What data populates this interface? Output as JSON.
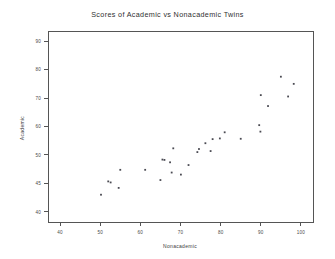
{
  "chart_data": {
    "type": "scatter",
    "title": "Scores of Academic vs Nonacademic Twins",
    "xlabel": "Nonacademic",
    "ylabel": "Academic",
    "xlim": [
      37,
      103
    ],
    "ylim": [
      37,
      93
    ],
    "xticks": [
      40,
      50,
      60,
      70,
      80,
      90,
      100
    ],
    "xticklabels": [
      "40",
      "50",
      "60",
      "70",
      "80",
      "90",
      "100"
    ],
    "yticks": [
      40,
      48.3,
      56.7,
      65,
      73.3,
      81.7,
      90
    ],
    "yticklabels": [
      "40",
      "45",
      "50",
      "60",
      "70",
      "80",
      "90"
    ],
    "grid": false,
    "legend": false,
    "marker": "point",
    "marker_color": "#4a4a52",
    "points": [
      {
        "x": 50.2,
        "y": 45.0
      },
      {
        "x": 52.6,
        "y": 48.6
      },
      {
        "x": 52.0,
        "y": 48.9
      },
      {
        "x": 54.6,
        "y": 47.0
      },
      {
        "x": 55.0,
        "y": 52.3
      },
      {
        "x": 61.2,
        "y": 52.3
      },
      {
        "x": 65.0,
        "y": 49.3
      },
      {
        "x": 65.5,
        "y": 55.3
      },
      {
        "x": 66.0,
        "y": 55.2
      },
      {
        "x": 67.4,
        "y": 54.5
      },
      {
        "x": 67.8,
        "y": 51.5
      },
      {
        "x": 68.2,
        "y": 58.6
      },
      {
        "x": 70.1,
        "y": 50.9
      },
      {
        "x": 72.0,
        "y": 53.7
      },
      {
        "x": 74.2,
        "y": 57.5
      },
      {
        "x": 74.6,
        "y": 58.4
      },
      {
        "x": 76.2,
        "y": 60.1
      },
      {
        "x": 77.5,
        "y": 57.8
      },
      {
        "x": 78.0,
        "y": 61.3
      },
      {
        "x": 79.8,
        "y": 61.5
      },
      {
        "x": 81.0,
        "y": 63.3
      },
      {
        "x": 85.0,
        "y": 61.4
      },
      {
        "x": 89.6,
        "y": 65.4
      },
      {
        "x": 89.9,
        "y": 63.5
      },
      {
        "x": 90.0,
        "y": 74.2
      },
      {
        "x": 91.8,
        "y": 71.0
      },
      {
        "x": 95.0,
        "y": 79.6
      },
      {
        "x": 96.8,
        "y": 73.8
      },
      {
        "x": 98.2,
        "y": 77.5
      }
    ]
  },
  "axes": {
    "plot_left_px": 48,
    "plot_right_px": 313,
    "plot_top_px": 31,
    "plot_bottom_px": 222
  }
}
